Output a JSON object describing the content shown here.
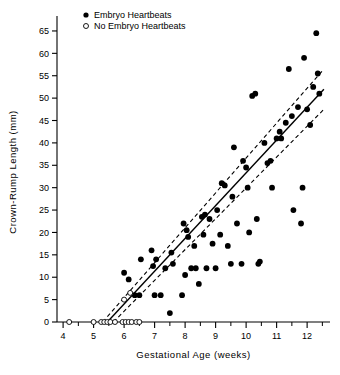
{
  "chart_data": {
    "type": "scatter",
    "title": "",
    "xlabel": "Gestational Age (weeks)",
    "ylabel": "Crown-Rump Length (mm)",
    "xlim": [
      3.8,
      12.75
    ],
    "ylim": [
      0,
      67
    ],
    "xticks": [
      4,
      5,
      6,
      7,
      8,
      9,
      10,
      11,
      12
    ],
    "xticklabels": [
      "4",
      "5",
      "6",
      "7",
      "8",
      "9",
      "10",
      "11",
      "12"
    ],
    "xminor_step": 0.5,
    "yticks": [
      0,
      5,
      10,
      15,
      20,
      25,
      30,
      35,
      40,
      45,
      50,
      55,
      60,
      65
    ],
    "yticklabels": [
      "0",
      "5",
      "10",
      "15",
      "20",
      "25",
      "30",
      "35",
      "40",
      "45",
      "50",
      "55",
      "60",
      "65"
    ],
    "grid": false,
    "legend_position": "top-left",
    "legend": [
      {
        "label": "Embryo Heartbeats",
        "marker": "filled-circle"
      },
      {
        "label": "No Embryo Heartbeats",
        "marker": "open-circle"
      }
    ],
    "series": [
      {
        "name": "Embryo Heartbeats",
        "marker": "filled-circle",
        "points": [
          [
            6.0,
            11.0
          ],
          [
            6.15,
            9.5
          ],
          [
            6.35,
            6.0
          ],
          [
            6.5,
            6.0
          ],
          [
            6.55,
            14.0
          ],
          [
            6.9,
            16.0
          ],
          [
            6.95,
            12.5
          ],
          [
            7.0,
            6.0
          ],
          [
            7.05,
            14.0
          ],
          [
            7.2,
            6.0
          ],
          [
            7.35,
            12.0
          ],
          [
            7.5,
            2.0
          ],
          [
            7.55,
            15.5
          ],
          [
            7.6,
            13.0
          ],
          [
            7.9,
            6.0
          ],
          [
            7.95,
            22.0
          ],
          [
            8.0,
            10.5
          ],
          [
            8.05,
            20.5
          ],
          [
            8.1,
            19.0
          ],
          [
            8.2,
            12.0
          ],
          [
            8.3,
            17.0
          ],
          [
            8.35,
            12.0
          ],
          [
            8.45,
            8.5
          ],
          [
            8.55,
            23.5
          ],
          [
            8.6,
            19.5
          ],
          [
            8.65,
            24.0
          ],
          [
            8.7,
            12.0
          ],
          [
            8.8,
            23.0
          ],
          [
            8.9,
            17.5
          ],
          [
            9.0,
            12.0
          ],
          [
            9.05,
            25.0
          ],
          [
            9.15,
            19.5
          ],
          [
            9.2,
            31.0
          ],
          [
            9.3,
            30.5
          ],
          [
            9.4,
            17.0
          ],
          [
            9.5,
            13.0
          ],
          [
            9.55,
            28.0
          ],
          [
            9.6,
            39.0
          ],
          [
            9.7,
            22.0
          ],
          [
            9.85,
            13.0
          ],
          [
            9.9,
            36.0
          ],
          [
            10.0,
            34.5
          ],
          [
            10.05,
            30.0
          ],
          [
            10.1,
            20.0
          ],
          [
            10.2,
            50.5
          ],
          [
            10.3,
            51.0
          ],
          [
            10.35,
            23.0
          ],
          [
            10.4,
            13.0
          ],
          [
            10.45,
            13.5
          ],
          [
            10.6,
            40.0
          ],
          [
            10.7,
            35.5
          ],
          [
            10.8,
            36.0
          ],
          [
            10.85,
            30.0
          ],
          [
            11.0,
            41.0
          ],
          [
            11.1,
            42.5
          ],
          [
            11.15,
            41.0
          ],
          [
            11.3,
            44.5
          ],
          [
            11.4,
            56.5
          ],
          [
            11.5,
            46.0
          ],
          [
            11.55,
            25.0
          ],
          [
            11.7,
            48.0
          ],
          [
            11.8,
            22.0
          ],
          [
            11.85,
            30.0
          ],
          [
            11.9,
            59.0
          ],
          [
            12.0,
            47.5
          ],
          [
            12.1,
            44.0
          ],
          [
            12.2,
            52.5
          ],
          [
            12.3,
            64.5
          ],
          [
            12.35,
            55.5
          ],
          [
            12.4,
            51.0
          ]
        ]
      },
      {
        "name": "No Embryo Heartbeats",
        "marker": "open-circle",
        "points": [
          [
            4.2,
            0.0
          ],
          [
            5.0,
            0.0
          ],
          [
            5.25,
            0.0
          ],
          [
            5.35,
            0.0
          ],
          [
            5.45,
            0.0
          ],
          [
            5.55,
            0.0
          ],
          [
            5.7,
            0.0
          ],
          [
            5.95,
            0.0
          ],
          [
            6.05,
            0.0
          ],
          [
            6.15,
            0.0
          ],
          [
            6.25,
            0.0
          ],
          [
            6.4,
            0.0
          ],
          [
            6.5,
            0.0
          ],
          [
            6.0,
            5.0
          ],
          [
            6.2,
            6.5
          ]
        ]
      }
    ],
    "fit_line": {
      "label": "regression-line",
      "style": "solid",
      "x_start": 5.45,
      "x_end": 12.55,
      "y_start": 0.0,
      "y_end": 52.0
    },
    "confidence_bands": [
      {
        "label": "upper-confidence-band",
        "style": "dashed",
        "x_start": 5.3,
        "x_end": 12.55,
        "y_start": 0.0,
        "y_end": 56.5
      },
      {
        "label": "lower-confidence-band",
        "style": "dashed",
        "x_start": 5.65,
        "x_end": 12.55,
        "y_start": 0.0,
        "y_end": 47.5
      }
    ]
  }
}
